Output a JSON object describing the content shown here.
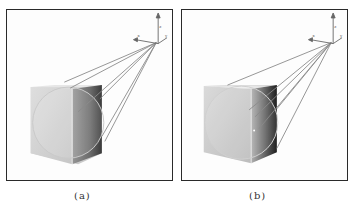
{
  "figure": {
    "panels": [
      {
        "id": "a",
        "caption": "(a)",
        "description": "Cube with inscribed sphere; rays from viewpoint with coordinate axes at top-right",
        "axes_labels": [
          "z",
          "x",
          "y"
        ]
      },
      {
        "id": "b",
        "caption": "(b)",
        "description": "Cube with inscribed sphere; rays from viewpoint hitting cube side with darker shaded face",
        "axes_labels": [
          "z",
          "x",
          "y"
        ]
      }
    ]
  },
  "colors": {
    "frame": "#2a2a2a",
    "background": "#fdfdfd",
    "cube_front": "#d9d9d9",
    "cube_top": "#e8e8e8",
    "cube_side_a": "#4a4a4a",
    "cube_side_b": "#5a5a5a",
    "ray": "#8a8a8a",
    "sphere_outline": "#bdbdbd"
  }
}
